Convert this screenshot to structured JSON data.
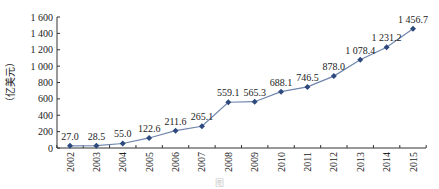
{
  "chart_data": {
    "type": "line",
    "title": "",
    "xlabel": "",
    "ylabel": "（亿美元）",
    "ylim": [
      0,
      1600
    ],
    "yticks": [
      0,
      200,
      400,
      600,
      800,
      1000,
      1200,
      1400,
      1600
    ],
    "ytick_labels": [
      "0",
      "200",
      "400",
      "600",
      "800",
      "1 000",
      "1 200",
      "1 400",
      "1 600"
    ],
    "grid": false,
    "legend": null,
    "categories": [
      "2002",
      "2003",
      "2004",
      "2005",
      "2006",
      "2007",
      "2008",
      "2009",
      "2010",
      "2011",
      "2012",
      "2013",
      "2014",
      "2015"
    ],
    "series": [
      {
        "name": "",
        "color": "#2e4a7d",
        "values": [
          27.0,
          28.5,
          55.0,
          122.6,
          211.6,
          265.1,
          559.1,
          565.3,
          688.1,
          746.5,
          878.0,
          1078.4,
          1231.2,
          1456.7
        ],
        "labels": [
          "27.0",
          "28.5",
          "55.0",
          "122.6",
          "211.6",
          "265.1",
          "559.1",
          "565.3",
          "688.1",
          "746.5",
          "878.0",
          "1 078.4",
          "1 231.2",
          "1 456.7"
        ]
      }
    ]
  },
  "caption": "图"
}
